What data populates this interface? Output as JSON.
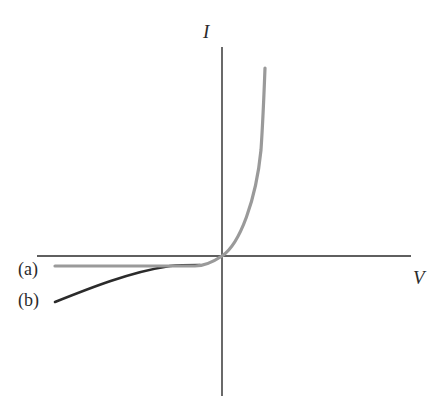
{
  "diagram": {
    "type": "current-voltage characteristic",
    "axes": {
      "x_label": "V",
      "y_label": "I"
    },
    "curves": [
      {
        "id": "a",
        "label": "(a)",
        "color": "#9a9a9a",
        "description": "exponential rise for V>0, flat saturation current for V<0"
      },
      {
        "id": "b",
        "label": "(b)",
        "color": "#2b2b2b",
        "description": "reverse-bias current grows in magnitude with negative V"
      }
    ],
    "colors": {
      "axis": "#2a2a2a",
      "background": "#ffffff"
    }
  }
}
